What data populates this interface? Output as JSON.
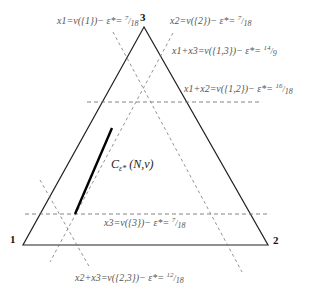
{
  "diagram": {
    "type": "simplex-core-diagram",
    "vertices": [
      {
        "label": "1",
        "x": 23,
        "y": 245
      },
      {
        "label": "2",
        "x": 268,
        "y": 245
      },
      {
        "label": "3",
        "x": 144,
        "y": 27
      }
    ],
    "core_label": {
      "symbol": "C",
      "subscript": "ε*",
      "args": "(N,v)"
    },
    "constraints": [
      {
        "id": "x1",
        "text": "x1=v({1})− ε*=",
        "num": "7",
        "den": "18"
      },
      {
        "id": "x2",
        "text": "x2=v({2})− ε*=",
        "num": "7",
        "den": "18"
      },
      {
        "id": "x1x3",
        "text": "x1+x3=v({1,3})− ε*=",
        "num": "14",
        "den": "9"
      },
      {
        "id": "x1x2",
        "text": "x1+x2=v({1,2})− ε*=",
        "num": "16",
        "den": "18"
      },
      {
        "id": "x3",
        "text": "x3=v({3})− ε*=",
        "num": "7",
        "den": "18"
      },
      {
        "id": "x2x3",
        "text": "x2+x3=v({2,3})− ε*=",
        "num": "12",
        "den": "18"
      }
    ],
    "colors": {
      "triangle": "#222222",
      "dashed": "#777777",
      "core_segment": "#000000",
      "text": "#555555"
    }
  }
}
